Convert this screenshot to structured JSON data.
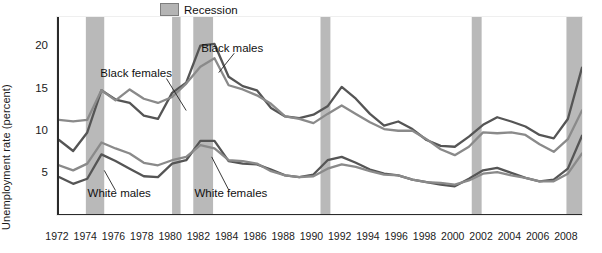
{
  "chart_data": {
    "type": "line",
    "title": "",
    "subtitle": "",
    "xlabel": "",
    "ylabel": "Unemployment rate (percent)",
    "xlim": [
      1972,
      2009
    ],
    "ylim": [
      0,
      23.5
    ],
    "yticks": [
      5,
      10,
      15,
      20
    ],
    "xticks": [
      1972,
      1974,
      1976,
      1978,
      1980,
      1982,
      1984,
      1986,
      1988,
      1990,
      1992,
      1994,
      1996,
      1998,
      2000,
      2002,
      2004,
      2006,
      2008
    ],
    "xtick_labels": [
      "1972",
      "1974",
      "1976",
      "1978",
      "1980",
      "1982",
      "1984",
      "1986",
      "1988",
      "1990",
      "1992",
      "1994",
      "1996",
      "1998",
      "2000",
      "2002",
      "2004",
      "2006",
      "2008"
    ],
    "minor_ticks_every": 1,
    "grid": false,
    "legend_position": "top-center",
    "legend": [
      {
        "label": "Recession",
        "color": "#b4b4b4",
        "type": "band"
      }
    ],
    "annotations": [
      {
        "text": "Black females",
        "x": 1977.6,
        "y": 16.6
      },
      {
        "text": "Black males",
        "x": 1984.4,
        "y": 19.6
      },
      {
        "text": "White males",
        "x": 1976.4,
        "y": 2.4
      },
      {
        "text": "White females",
        "x": 1984.3,
        "y": 2.4
      }
    ],
    "recession_bands": [
      {
        "start": 1973.9,
        "end": 1975.2
      },
      {
        "start": 1980.0,
        "end": 1980.6
      },
      {
        "start": 1981.5,
        "end": 1982.9
      },
      {
        "start": 1990.5,
        "end": 1991.2
      },
      {
        "start": 2001.2,
        "end": 2001.9
      },
      {
        "start": 2007.9,
        "end": 2009.0
      }
    ],
    "x": [
      1972,
      1973,
      1974,
      1975,
      1976,
      1977,
      1978,
      1979,
      1980,
      1981,
      1982,
      1983,
      1984,
      1985,
      1986,
      1987,
      1988,
      1989,
      1990,
      1991,
      1992,
      1993,
      1994,
      1995,
      1996,
      1997,
      1998,
      1999,
      2000,
      2001,
      2002,
      2003,
      2004,
      2005,
      2006,
      2007,
      2008,
      2009
    ],
    "series": [
      {
        "name": "Black males",
        "color": "#555555",
        "values": [
          8.9,
          7.6,
          9.8,
          14.8,
          13.7,
          13.3,
          11.8,
          11.4,
          14.5,
          15.7,
          20.1,
          20.3,
          16.4,
          15.3,
          14.8,
          12.7,
          11.7,
          11.5,
          11.9,
          12.9,
          15.2,
          13.8,
          12.0,
          10.6,
          11.1,
          10.2,
          8.9,
          8.2,
          8.1,
          9.3,
          10.7,
          11.6,
          11.1,
          10.5,
          9.5,
          9.1,
          11.4,
          17.5
        ]
      },
      {
        "name": "Black females",
        "color": "#8a8a8a",
        "values": [
          11.3,
          11.1,
          11.3,
          14.8,
          13.6,
          14.9,
          13.8,
          13.3,
          14.0,
          15.6,
          17.6,
          18.6,
          15.4,
          14.9,
          14.2,
          13.2,
          11.7,
          11.4,
          10.9,
          12.0,
          13.0,
          12.0,
          11.0,
          10.2,
          10.0,
          10.0,
          9.0,
          7.8,
          7.1,
          8.1,
          9.8,
          9.7,
          9.8,
          9.5,
          8.4,
          7.5,
          9.0,
          12.4
        ]
      },
      {
        "name": "White males",
        "color": "#555555",
        "values": [
          4.5,
          3.7,
          4.3,
          7.2,
          6.4,
          5.5,
          4.6,
          4.5,
          6.1,
          6.5,
          8.8,
          8.8,
          6.4,
          6.1,
          6.0,
          5.4,
          4.7,
          4.5,
          4.8,
          6.5,
          6.9,
          6.2,
          5.4,
          4.9,
          4.7,
          4.2,
          3.9,
          3.6,
          3.4,
          4.3,
          5.3,
          5.6,
          5.0,
          4.4,
          4.0,
          4.2,
          5.5,
          9.4
        ]
      },
      {
        "name": "White females",
        "color": "#8a8a8a",
        "values": [
          5.9,
          5.3,
          6.1,
          8.6,
          7.9,
          7.3,
          6.2,
          5.9,
          6.5,
          6.9,
          8.3,
          7.9,
          6.5,
          6.4,
          6.1,
          5.2,
          4.7,
          4.5,
          4.6,
          5.5,
          6.0,
          5.7,
          5.2,
          4.8,
          4.7,
          4.2,
          3.9,
          3.8,
          3.6,
          4.1,
          4.9,
          5.1,
          4.7,
          4.4,
          4.0,
          4.0,
          4.9,
          7.3
        ]
      }
    ]
  },
  "yaxis": {
    "label": "Unemployment rate (percent)",
    "tick_labels": [
      "20",
      "15",
      "10",
      "5"
    ]
  },
  "legend": {
    "recession_label": "Recession"
  },
  "labels": {
    "black_females": "Black females",
    "black_males": "Black males",
    "white_males": "White males",
    "white_females": "White females"
  }
}
